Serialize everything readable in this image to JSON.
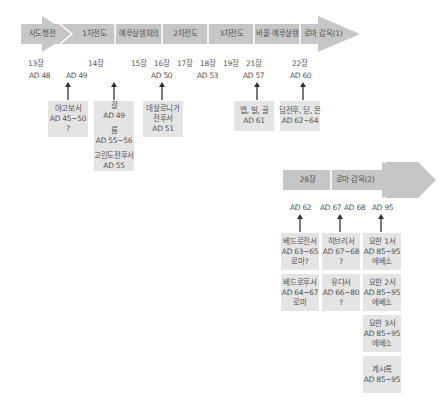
{
  "colors": {
    "arrow": "#c6c6c6",
    "box": "#e4e4e4",
    "text": "#555555",
    "separator": "#ffffff",
    "pointer": "#333333"
  },
  "timeline1": {
    "segments": [
      "사도행전",
      "1차전도",
      "예루살렘회의",
      "2차전도",
      "3차전도",
      "바울·예루살렘",
      "로마 감옥(1)"
    ],
    "chapters": [
      "13장",
      "14장",
      "15장",
      "16장",
      "17장",
      "18장",
      "19장",
      "21장",
      "22장"
    ],
    "dates": [
      "AD 48",
      "AD 49",
      "AD 50",
      "AD 53",
      "AD 57",
      "AD 60"
    ],
    "letters": [
      {
        "lines": [
          "야고보서",
          "AD 45~50",
          "?"
        ]
      },
      {
        "groups": [
          [
            "갈",
            "AD 49"
          ],
          [
            "롬",
            "AD 55~56"
          ],
          [
            "고린도전후서",
            "AD 55"
          ]
        ]
      },
      {
        "lines": [
          "데살로니가",
          "전후서",
          "AD 51"
        ]
      },
      {
        "lines": [
          "엡, 빌, 골",
          "AD 61"
        ]
      },
      {
        "lines": [
          "딤전후, 딛, 몬",
          "AD 62~64"
        ]
      }
    ]
  },
  "timeline2": {
    "segments": [
      "28장",
      "로마 감옥(2)"
    ],
    "dates": [
      "AD 62",
      "AD 67",
      "AD 68",
      "AD 95"
    ],
    "letters": [
      {
        "lines": [
          "베드로전서",
          "AD 63~65",
          "로마?"
        ]
      },
      {
        "lines": [
          "히브리서",
          "AD 67~68",
          "?"
        ]
      },
      {
        "lines": [
          "요한 1서",
          "AD 85~95",
          "에베소"
        ]
      },
      {
        "lines": [
          "베드로후서",
          "AD 64~67",
          "로마"
        ]
      },
      {
        "lines": [
          "유다서",
          "AD 66~80",
          "?"
        ]
      },
      {
        "lines": [
          "요한 2서",
          "AD 85~95",
          "에베소"
        ]
      },
      {
        "lines": [
          "요한 3서",
          "AD 85~95",
          "에베소"
        ]
      },
      {
        "lines": [
          "계시록",
          "AD 85~95"
        ]
      }
    ]
  }
}
